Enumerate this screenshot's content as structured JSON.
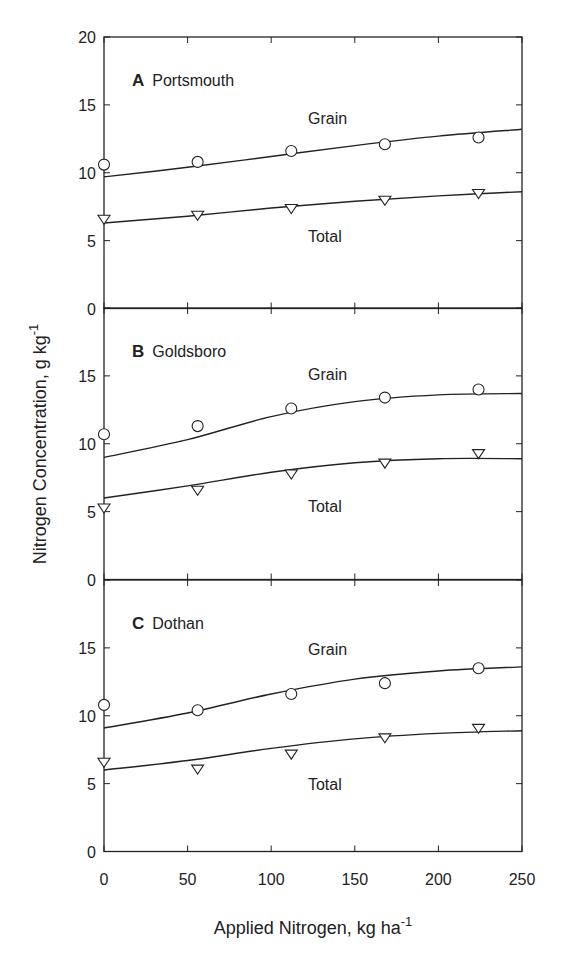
{
  "chart_data": {
    "type": "scatter",
    "layout": "three vertically stacked panels sharing x axis",
    "xlabel": "Applied Nitrogen, kg ha",
    "xlabel_superscript": "-1",
    "ylabel": "Nitrogen Concentration, g kg",
    "ylabel_superscript": "-1",
    "xlim": [
      0,
      250
    ],
    "ylim": [
      0,
      20
    ],
    "x_ticks": [
      "0",
      "50",
      "100",
      "150",
      "200",
      "250"
    ],
    "y_ticks_top_panel": [
      "0",
      "5",
      "10",
      "15",
      "20"
    ],
    "y_ticks_other_panels": [
      "0",
      "5",
      "10",
      "15"
    ],
    "grid": false,
    "legend": "inline series labels (Grain, Total)",
    "panels": [
      {
        "letter": "A",
        "site": "Portsmouth",
        "series": [
          {
            "name": "Grain",
            "marker": "circle",
            "x": [
              0,
              56,
              112,
              168,
              224
            ],
            "values": [
              10.6,
              10.8,
              11.6,
              12.1,
              12.6
            ],
            "fit_x": [
              0,
              50,
              100,
              150,
              200,
              250
            ],
            "fit_y": [
              9.7,
              10.4,
              11.2,
              12.0,
              12.7,
              13.2
            ]
          },
          {
            "name": "Total",
            "marker": "triangle-down",
            "x": [
              0,
              56,
              112,
              168,
              224
            ],
            "values": [
              6.6,
              6.9,
              7.4,
              8.0,
              8.5
            ],
            "fit_x": [
              0,
              50,
              100,
              150,
              200,
              250
            ],
            "fit_y": [
              6.3,
              6.8,
              7.4,
              7.9,
              8.3,
              8.6
            ]
          }
        ],
        "label_positions": {
          "Grain": [
            122,
            13.6
          ],
          "Total": [
            122,
            4.9
          ]
        }
      },
      {
        "letter": "B",
        "site": "Goldsboro",
        "series": [
          {
            "name": "Grain",
            "marker": "circle",
            "x": [
              0,
              56,
              112,
              168,
              224
            ],
            "values": [
              10.7,
              11.3,
              12.6,
              13.4,
              14.0
            ],
            "fit_x": [
              0,
              50,
              100,
              150,
              200,
              250
            ],
            "fit_y": [
              9.0,
              10.3,
              12.0,
              13.1,
              13.6,
              13.7
            ]
          },
          {
            "name": "Total",
            "marker": "triangle-down",
            "x": [
              0,
              56,
              112,
              168,
              224
            ],
            "values": [
              5.3,
              6.6,
              7.8,
              8.6,
              9.3
            ],
            "fit_x": [
              0,
              50,
              100,
              150,
              200,
              250
            ],
            "fit_y": [
              6.0,
              6.9,
              7.9,
              8.6,
              8.9,
              8.9
            ]
          }
        ],
        "label_positions": {
          "Grain": [
            122,
            14.7
          ],
          "Total": [
            122,
            5.0
          ]
        }
      },
      {
        "letter": "C",
        "site": "Dothan",
        "series": [
          {
            "name": "Grain",
            "marker": "circle",
            "x": [
              0,
              56,
              112,
              168,
              224
            ],
            "values": [
              10.8,
              10.4,
              11.6,
              12.4,
              13.5
            ],
            "fit_x": [
              0,
              50,
              100,
              150,
              200,
              250
            ],
            "fit_y": [
              9.1,
              10.2,
              11.6,
              12.7,
              13.3,
              13.6
            ]
          },
          {
            "name": "Total",
            "marker": "triangle-down",
            "x": [
              0,
              56,
              112,
              168,
              224
            ],
            "values": [
              6.6,
              6.1,
              7.2,
              8.4,
              9.1
            ],
            "fit_x": [
              0,
              50,
              100,
              150,
              200,
              250
            ],
            "fit_y": [
              6.0,
              6.7,
              7.6,
              8.3,
              8.7,
              8.9
            ]
          }
        ],
        "label_positions": {
          "Grain": [
            122,
            14.5
          ],
          "Total": [
            122,
            4.5
          ]
        }
      }
    ]
  },
  "colors": {
    "ink": "#222222",
    "background": "#ffffff"
  }
}
